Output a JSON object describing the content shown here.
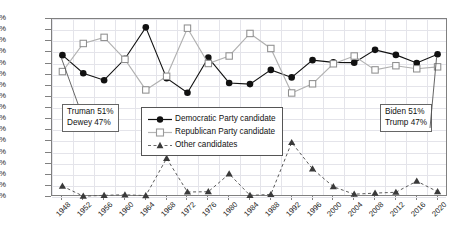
{
  "chart_data": {
    "type": "line",
    "title": "",
    "xlabel": "",
    "ylabel": "Share of votes (%)",
    "ylim": [
      0,
      64
    ],
    "ytick_step": 4,
    "grid": true,
    "legend_position": "center",
    "categories": [
      "1948",
      "1952",
      "1956",
      "1960",
      "1964",
      "1968",
      "1972",
      "1976",
      "1980",
      "1984",
      "1988",
      "1992",
      "1996",
      "2000",
      "2004",
      "2008",
      "2012",
      "2016",
      "2020"
    ],
    "series": [
      {
        "name": "Democratic Party candidate",
        "marker": "filled-circle",
        "line": "solid",
        "color": "#111111",
        "values": [
          51.0,
          44.5,
          42.0,
          49.7,
          61.0,
          42.7,
          37.5,
          50.1,
          41.0,
          40.6,
          45.7,
          43.0,
          49.2,
          48.4,
          48.3,
          52.9,
          51.1,
          48.2,
          51.3
        ]
      },
      {
        "name": "Republican Party candidate",
        "marker": "open-square",
        "line": "solid",
        "color": "#b0b0b0",
        "values": [
          45.1,
          55.2,
          57.4,
          49.5,
          38.5,
          43.4,
          60.7,
          48.0,
          50.7,
          58.8,
          53.4,
          37.4,
          40.7,
          47.9,
          50.7,
          45.7,
          47.2,
          46.1,
          46.8
        ]
      },
      {
        "name": "Other candidates",
        "marker": "filled-triangle",
        "line": "dashed",
        "color": "#5a5a5a",
        "values": [
          3.9,
          0.3,
          0.6,
          0.8,
          0.5,
          13.9,
          1.8,
          1.9,
          8.3,
          0.6,
          0.9,
          19.6,
          10.1,
          3.7,
          1.0,
          1.4,
          1.7,
          5.7,
          1.9
        ]
      }
    ],
    "ytick_labels": [
      "0%",
      "4%",
      "8%",
      "12%",
      "16%",
      "20%",
      "24%",
      "28%",
      "32%",
      "36%",
      "40%",
      "44%",
      "48%",
      "52%",
      "56%",
      "60%",
      "64%"
    ],
    "annotations": [
      {
        "id": "annot-left",
        "lines": [
          "Truman 51%",
          "Dewey 47%"
        ],
        "points_to": "1948"
      },
      {
        "id": "annot-right",
        "lines": [
          "Biden 51%",
          "Trump 47%"
        ],
        "points_to": "2020"
      }
    ]
  },
  "legend": {
    "items": [
      {
        "label": "Democratic Party candidate",
        "icon": "filled-circle-solid-line-icon"
      },
      {
        "label": "Republican Party candidate",
        "icon": "open-square-solid-line-icon"
      },
      {
        "label": "Other candidates",
        "icon": "filled-triangle-dashed-line-icon"
      }
    ]
  },
  "axis": {
    "y_title": "Share of votes (%)"
  }
}
